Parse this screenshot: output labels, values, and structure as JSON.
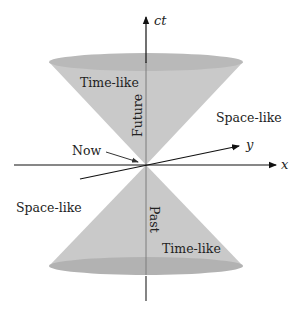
{
  "diagram": {
    "axes": {
      "ct": "ct",
      "x": "x",
      "y": "y"
    },
    "labels": {
      "time_like_future": "Time-like",
      "time_like_past": "Time-like",
      "future": "Future",
      "past": "Past",
      "space_like_right": "Space-like",
      "space_like_left": "Space-like",
      "now": "Now"
    },
    "colors": {
      "cone_fill": "#c8c8c8",
      "ellipse_fill": "#b4b4b4",
      "axis": "#111111",
      "inner_axis": "#7a7a7a",
      "background": "#ffffff"
    }
  }
}
